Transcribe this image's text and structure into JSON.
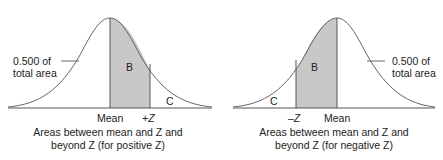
{
  "panels": [
    {
      "side_label_line1": "0.500 of",
      "side_label_line2": "total area",
      "region_b": "B",
      "region_c": "C",
      "axis_left": "Mean",
      "axis_right": "+Z",
      "caption_line1": "Areas between mean and Z and",
      "caption_line2": "beyond Z (for positive Z)"
    },
    {
      "side_label_line1": "0.500 of",
      "side_label_line2": "total area",
      "region_b": "B",
      "region_c": "C",
      "axis_left": "–Z",
      "axis_right": "Mean",
      "caption_line1": "Areas between mean and Z and",
      "caption_line2": "beyond Z (for negative Z)"
    }
  ],
  "colors": {
    "shade": "#c8c8c8",
    "line": "#444444"
  }
}
